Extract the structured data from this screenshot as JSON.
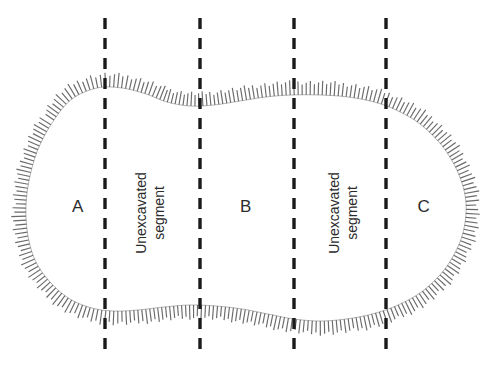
{
  "figure": {
    "type": "archaeological-trench-plan",
    "background_color": "#ffffff",
    "outline_color": "#555555",
    "hachure_color": "#5a5a5a",
    "dash_color": "#1a1a1a",
    "text_color": "#2b2b2b"
  },
  "excavated_segments": [
    {
      "id": "A",
      "label": "A",
      "x": 78,
      "y": 207
    },
    {
      "id": "B",
      "label": "B",
      "x": 246,
      "y": 207
    },
    {
      "id": "C",
      "label": "C",
      "x": 424,
      "y": 207
    }
  ],
  "unexcavated_segments": [
    {
      "id": "unexcavated-1",
      "line1": "Unexcavated",
      "line2": "segment",
      "x": 150,
      "y": 213
    },
    {
      "id": "unexcavated-2",
      "line1": "Unexcavated",
      "line2": "segment",
      "x": 343,
      "y": 213
    }
  ],
  "division_lines": [
    {
      "id": "division-line-1",
      "x": 105,
      "y_top": 18,
      "y_bottom": 355
    },
    {
      "id": "division-line-2",
      "x": 200,
      "y_top": 18,
      "y_bottom": 355
    },
    {
      "id": "division-line-3",
      "x": 294,
      "y_top": 18,
      "y_bottom": 355
    },
    {
      "id": "division-line-4",
      "x": 386,
      "y_top": 18,
      "y_bottom": 355
    }
  ],
  "trench_outline": {
    "description": "elongated rounded excavation edge with outward hachure ticks",
    "bounds": {
      "left": 25,
      "right": 470,
      "top": 85,
      "bottom": 322
    }
  }
}
